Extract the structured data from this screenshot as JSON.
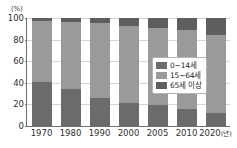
{
  "chart_data": {
    "type": "bar",
    "subtype": "stacked-100-percent",
    "title": "",
    "xlabel": "년",
    "ylabel": "",
    "unit_label": "(%)",
    "categories": [
      "1970",
      "1980",
      "1990",
      "2000",
      "2005",
      "2010",
      "2020"
    ],
    "x_axis_suffix": "(년)",
    "ylim": [
      0,
      100
    ],
    "yticks": [
      0,
      20,
      40,
      60,
      80,
      100
    ],
    "ytick_labels": [
      "0",
      "20",
      "40",
      "60",
      "80",
      "100"
    ],
    "grid": true,
    "grid_axis": "y",
    "legend_position": "center-right",
    "series": [
      {
        "name": "0~14세",
        "key": "youth",
        "color": "#6b6b6b",
        "values": [
          41,
          34,
          26,
          21,
          19,
          16,
          12
        ]
      },
      {
        "name": "15~64세",
        "key": "working",
        "color": "#9a9a9a",
        "values": [
          56,
          62,
          69,
          72,
          72,
          73,
          72
        ]
      },
      {
        "name": "65세 이상",
        "key": "senior",
        "color": "#5e5e5e",
        "values": [
          3,
          4,
          5,
          7,
          9,
          11,
          16
        ]
      }
    ],
    "stack_order_top_to_bottom": [
      "senior",
      "working",
      "youth"
    ]
  },
  "colors": {
    "axis": "#6e6e6e",
    "gridline": "#d6d6d6",
    "text": "#2f2f2f",
    "background": "#ffffff",
    "legend_border": "#b4b4b4"
  }
}
